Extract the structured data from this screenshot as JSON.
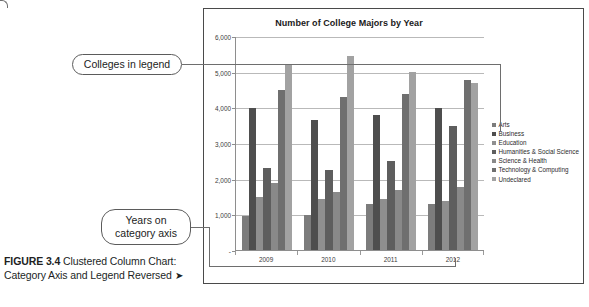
{
  "caption": {
    "figure_number": "FIGURE 3.4",
    "text": " Clustered Column Chart: Category Axis and Legend Reversed ",
    "arrow": "➤"
  },
  "callouts": [
    {
      "id": "legend",
      "text": "Colleges in legend"
    },
    {
      "id": "category-axis",
      "text": "Years on category axis"
    }
  ],
  "chart_data": {
    "type": "bar",
    "title": "Number of College Majors by Year",
    "xlabel": "",
    "ylabel": "",
    "categories": [
      "2009",
      "2010",
      "2011",
      "2012"
    ],
    "ylim": [
      0,
      6000
    ],
    "yticks": [
      0,
      1000,
      2000,
      3000,
      4000,
      5000,
      6000
    ],
    "ytick_labels": [
      "-",
      "1,000",
      "2,000",
      "3,000",
      "4,000",
      "5,000",
      "6,000"
    ],
    "grid": true,
    "legend_position": "right",
    "series": [
      {
        "name": "Arts",
        "color": "#7c7c7c",
        "values": [
          950,
          990,
          1290,
          1280
        ]
      },
      {
        "name": "Business",
        "color": "#4e4e4e",
        "values": [
          3975,
          3640,
          3780,
          3990
        ]
      },
      {
        "name": "Education",
        "color": "#8f8f8f",
        "values": [
          1500,
          1420,
          1420,
          1370
        ]
      },
      {
        "name": "Humanities & Social Science",
        "color": "#5e5e5e",
        "values": [
          2300,
          2230,
          2490,
          3490
        ]
      },
      {
        "name": "Science & Health",
        "color": "#898989",
        "values": [
          1880,
          1640,
          1690,
          1780
        ]
      },
      {
        "name": "Technology & Computing",
        "color": "#6f6f6f",
        "values": [
          4475,
          4300,
          4370,
          4780
        ]
      },
      {
        "name": "Undeclared",
        "color": "#a2a2a2",
        "values": [
          5180,
          5430,
          4980,
          4670
        ]
      }
    ]
  }
}
